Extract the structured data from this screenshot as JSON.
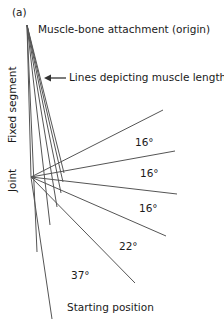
{
  "panel_label": "(a)",
  "labels": {
    "origin": "Muscle-bone attachment (origin)",
    "muscle_lines": "Lines depicting muscle lengths",
    "fixed_segment": "Fixed segment",
    "joint": "Joint",
    "starting_position": "Starting position"
  },
  "angles": [
    {
      "label": "16°"
    },
    {
      "label": "16°"
    },
    {
      "label": "16°"
    },
    {
      "label": "22°"
    },
    {
      "label": "37°"
    }
  ],
  "colors": {
    "line": "#555555",
    "text": "#1a1a1a"
  }
}
